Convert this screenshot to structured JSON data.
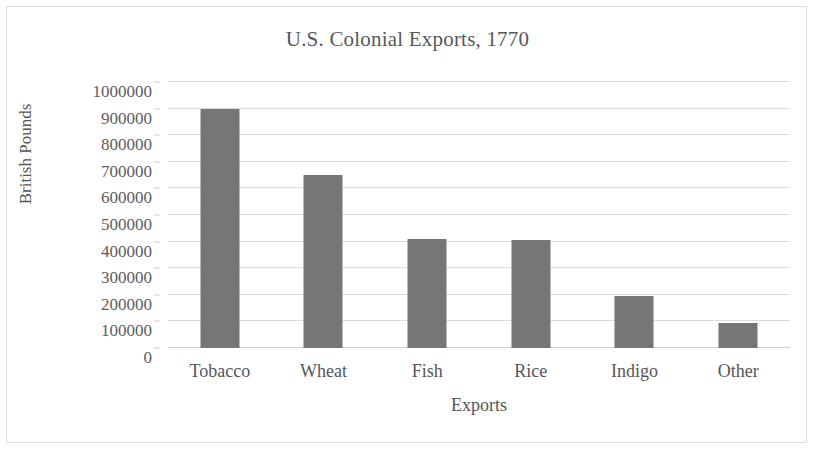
{
  "chart_data": {
    "type": "bar",
    "title": "U.S. Colonial Exports, 1770",
    "xlabel": "Exports",
    "ylabel": "British Pounds",
    "categories": [
      "Tobacco",
      "Wheat",
      "Fish",
      "Rice",
      "Indigo",
      "Other"
    ],
    "values": [
      900000,
      650000,
      410000,
      405000,
      195000,
      95000
    ],
    "ylim": [
      0,
      1000000
    ],
    "ytick_values": [
      0,
      100000,
      200000,
      300000,
      400000,
      500000,
      600000,
      700000,
      800000,
      900000,
      1000000
    ],
    "ytick_labels": [
      "0",
      "100000",
      "200000",
      "300000",
      "400000",
      "500000",
      "600000",
      "700000",
      "800000",
      "900000",
      "1000000"
    ],
    "grid": true,
    "legend": null,
    "bar_color": "#767676",
    "gridline_color": "#dadada",
    "text_color": "#55555a",
    "background_color": "#ffffff"
  }
}
